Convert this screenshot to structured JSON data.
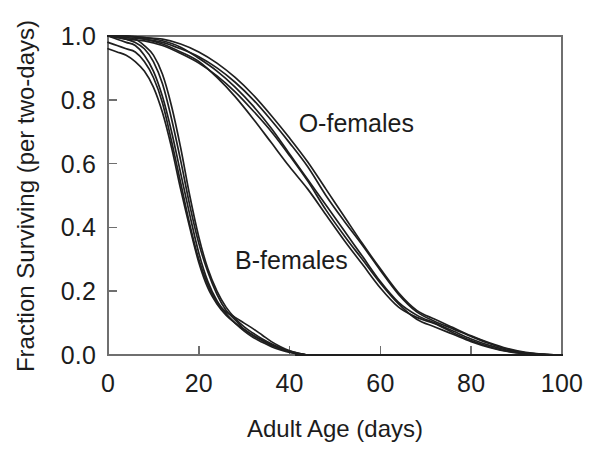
{
  "figure": {
    "background_color": "#ffffff",
    "line_color": "#1f1f1f",
    "axis_color": "#6f6f6f"
  },
  "chart_data": {
    "type": "line",
    "title": "",
    "subtitle": "",
    "xlabel": "Adult Age (days)",
    "ylabel": "Fraction Surviving (per two-days)",
    "xlim": [
      0,
      100
    ],
    "ylim": [
      0.0,
      1.0
    ],
    "xticks": [
      0,
      20,
      40,
      60,
      80,
      100
    ],
    "xticklabels": [
      "0",
      "20",
      "40",
      "60",
      "80",
      "100"
    ],
    "yticks": [
      0.0,
      0.2,
      0.4,
      0.6,
      0.8,
      1.0
    ],
    "yticklabels": [
      "0.0",
      "0.2",
      "0.4",
      "0.6",
      "0.8",
      "1.0"
    ],
    "grid": false,
    "legend_position": "inline-annotation",
    "annotations": [
      {
        "text": "O-females",
        "x": 42,
        "y": 0.7
      },
      {
        "text": "B-females",
        "x": 28,
        "y": 0.27
      }
    ],
    "series": [
      {
        "name": "B-females replicate 1",
        "group": "B-females",
        "x": [
          0,
          2,
          4,
          6,
          8,
          10,
          12,
          14,
          16,
          18,
          20,
          22,
          24,
          26,
          28,
          30,
          32,
          34,
          36,
          38,
          40,
          42,
          44,
          46,
          100
        ],
        "y": [
          1.0,
          1.0,
          0.99,
          0.98,
          0.96,
          0.92,
          0.85,
          0.74,
          0.61,
          0.47,
          0.35,
          0.26,
          0.19,
          0.14,
          0.11,
          0.08,
          0.06,
          0.045,
          0.03,
          0.02,
          0.01,
          0.004,
          0.0,
          0.0,
          0.0
        ]
      },
      {
        "name": "B-females replicate 2",
        "group": "B-females",
        "x": [
          0,
          2,
          4,
          6,
          8,
          10,
          12,
          14,
          16,
          18,
          20,
          22,
          24,
          26,
          28,
          30,
          32,
          34,
          36,
          38,
          40,
          42,
          44,
          46,
          100
        ],
        "y": [
          1.0,
          0.99,
          0.98,
          0.97,
          0.94,
          0.89,
          0.81,
          0.7,
          0.57,
          0.44,
          0.32,
          0.23,
          0.17,
          0.13,
          0.1,
          0.075,
          0.055,
          0.04,
          0.026,
          0.016,
          0.008,
          0.003,
          0.0,
          0.0,
          0.0
        ]
      },
      {
        "name": "B-females replicate 3",
        "group": "B-females",
        "x": [
          0,
          2,
          4,
          6,
          8,
          10,
          12,
          14,
          16,
          18,
          20,
          22,
          24,
          26,
          28,
          30,
          32,
          34,
          36,
          38,
          40,
          42,
          44,
          46,
          100
        ],
        "y": [
          0.96,
          0.95,
          0.94,
          0.92,
          0.89,
          0.84,
          0.76,
          0.65,
          0.52,
          0.4,
          0.29,
          0.21,
          0.16,
          0.125,
          0.1,
          0.08,
          0.062,
          0.046,
          0.032,
          0.02,
          0.011,
          0.004,
          0.0,
          0.0,
          0.0
        ]
      },
      {
        "name": "B-females replicate 4",
        "group": "B-females",
        "x": [
          0,
          2,
          4,
          6,
          8,
          10,
          12,
          14,
          16,
          18,
          20,
          22,
          24,
          26,
          28,
          30,
          32,
          34,
          36,
          38,
          40,
          42,
          44,
          46,
          100
        ],
        "y": [
          1.0,
          1.0,
          0.99,
          0.99,
          0.97,
          0.94,
          0.88,
          0.78,
          0.65,
          0.5,
          0.37,
          0.27,
          0.2,
          0.15,
          0.115,
          0.088,
          0.068,
          0.05,
          0.035,
          0.022,
          0.012,
          0.005,
          0.0,
          0.0,
          0.0
        ]
      },
      {
        "name": "B-females replicate 5",
        "group": "B-females",
        "x": [
          0,
          2,
          4,
          6,
          8,
          10,
          12,
          14,
          16,
          18,
          20,
          22,
          24,
          26,
          28,
          30,
          32,
          34,
          36,
          38,
          40,
          42,
          44,
          46,
          100
        ],
        "y": [
          0.98,
          0.97,
          0.96,
          0.95,
          0.92,
          0.87,
          0.79,
          0.67,
          0.54,
          0.41,
          0.3,
          0.22,
          0.165,
          0.135,
          0.118,
          0.1,
          0.082,
          0.062,
          0.042,
          0.026,
          0.013,
          0.005,
          0.0,
          0.0,
          0.0
        ]
      },
      {
        "name": "O-females replicate 1",
        "group": "O-females",
        "x": [
          0,
          4,
          8,
          12,
          16,
          20,
          24,
          28,
          32,
          36,
          40,
          44,
          48,
          52,
          56,
          60,
          64,
          68,
          72,
          76,
          80,
          84,
          88,
          92,
          96,
          100
        ],
        "y": [
          1.0,
          1.0,
          0.995,
          0.985,
          0.965,
          0.93,
          0.89,
          0.84,
          0.78,
          0.71,
          0.63,
          0.55,
          0.47,
          0.39,
          0.31,
          0.23,
          0.165,
          0.125,
          0.1,
          0.075,
          0.05,
          0.03,
          0.015,
          0.006,
          0.002,
          0.0
        ]
      },
      {
        "name": "O-females replicate 2",
        "group": "O-females",
        "x": [
          0,
          4,
          8,
          12,
          16,
          20,
          24,
          28,
          32,
          36,
          40,
          44,
          48,
          52,
          56,
          60,
          64,
          68,
          72,
          76,
          80,
          84,
          88,
          92,
          96,
          100
        ],
        "y": [
          1.0,
          0.995,
          0.99,
          0.975,
          0.95,
          0.92,
          0.87,
          0.81,
          0.74,
          0.665,
          0.59,
          0.52,
          0.44,
          0.36,
          0.285,
          0.21,
          0.15,
          0.118,
          0.098,
          0.07,
          0.045,
          0.026,
          0.012,
          0.005,
          0.001,
          0.0
        ]
      },
      {
        "name": "O-females replicate 3",
        "group": "O-females",
        "x": [
          0,
          4,
          8,
          12,
          16,
          20,
          24,
          28,
          32,
          36,
          40,
          44,
          48,
          52,
          56,
          60,
          64,
          68,
          72,
          76,
          80,
          84,
          88,
          92,
          96,
          100
        ],
        "y": [
          1.0,
          1.0,
          0.99,
          0.98,
          0.96,
          0.935,
          0.9,
          0.855,
          0.8,
          0.735,
          0.665,
          0.59,
          0.5,
          0.42,
          0.345,
          0.265,
          0.19,
          0.135,
          0.105,
          0.082,
          0.058,
          0.036,
          0.018,
          0.007,
          0.002,
          0.0
        ]
      },
      {
        "name": "O-females replicate 4",
        "group": "O-females",
        "x": [
          0,
          4,
          8,
          12,
          16,
          20,
          24,
          28,
          32,
          36,
          40,
          44,
          48,
          52,
          56,
          60,
          64,
          68,
          72,
          76,
          80,
          84,
          88,
          92,
          96,
          100
        ],
        "y": [
          1.0,
          0.99,
          0.985,
          0.97,
          0.945,
          0.915,
          0.875,
          0.825,
          0.765,
          0.7,
          0.625,
          0.545,
          0.455,
          0.375,
          0.3,
          0.225,
          0.16,
          0.112,
          0.088,
          0.065,
          0.042,
          0.024,
          0.011,
          0.004,
          0.001,
          0.0
        ]
      },
      {
        "name": "O-females replicate 5",
        "group": "O-females",
        "x": [
          0,
          4,
          8,
          12,
          16,
          20,
          24,
          28,
          32,
          36,
          40,
          44,
          48,
          52,
          56,
          60,
          64,
          68,
          72,
          76,
          80,
          84,
          88,
          92,
          96,
          100
        ],
        "y": [
          1.0,
          1.0,
          0.995,
          0.99,
          0.975,
          0.95,
          0.915,
          0.87,
          0.815,
          0.75,
          0.68,
          0.605,
          0.52,
          0.435,
          0.35,
          0.27,
          0.195,
          0.14,
          0.112,
          0.086,
          0.06,
          0.038,
          0.02,
          0.008,
          0.002,
          0.0
        ]
      }
    ]
  }
}
